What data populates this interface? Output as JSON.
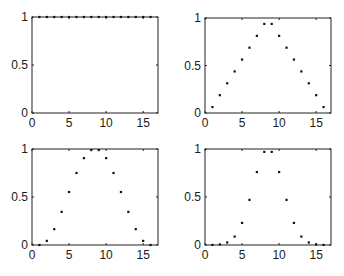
{
  "figure": {
    "background": "#ffffff",
    "axis_color": "#222222",
    "marker_color": "#111111"
  },
  "chart_data": [
    {
      "type": "scatter",
      "panel": "top-left",
      "title": "",
      "xlabel": "",
      "ylabel": "",
      "xlim": [
        0,
        17
      ],
      "ylim": [
        0,
        1
      ],
      "xticks": [
        0,
        5,
        10,
        15
      ],
      "xtick_labels": [
        "0",
        "5",
        "10",
        "15"
      ],
      "yticks": [
        0,
        0.5,
        1
      ],
      "ytick_labels": [
        "0",
        "0.5",
        "1"
      ],
      "grid": false,
      "legend": null,
      "x": [
        1,
        2,
        3,
        4,
        5,
        6,
        7,
        8,
        9,
        10,
        11,
        12,
        13,
        14,
        15,
        16
      ],
      "y": [
        1,
        1,
        1,
        1,
        1,
        1,
        1,
        1,
        1,
        1,
        1,
        1,
        1,
        1,
        1,
        1
      ]
    },
    {
      "type": "scatter",
      "panel": "top-right",
      "title": "",
      "xlabel": "",
      "ylabel": "",
      "xlim": [
        0,
        17
      ],
      "ylim": [
        0,
        1
      ],
      "xticks": [
        0,
        5,
        10,
        15
      ],
      "xtick_labels": [
        "0",
        "5",
        "10",
        "15"
      ],
      "yticks": [
        0,
        0.5,
        1
      ],
      "ytick_labels": [
        "0",
        "0.5",
        "1"
      ],
      "grid": false,
      "legend": null,
      "x": [
        1,
        2,
        3,
        4,
        5,
        6,
        7,
        8,
        9,
        10,
        11,
        12,
        13,
        14,
        15,
        16
      ],
      "y": [
        0.0625,
        0.1875,
        0.3125,
        0.4375,
        0.5625,
        0.6875,
        0.8125,
        0.9375,
        0.9375,
        0.8125,
        0.6875,
        0.5625,
        0.4375,
        0.3125,
        0.1875,
        0.0625
      ]
    },
    {
      "type": "scatter",
      "panel": "bottom-left",
      "title": "",
      "xlabel": "",
      "ylabel": "",
      "xlim": [
        0,
        17
      ],
      "ylim": [
        0,
        1
      ],
      "xticks": [
        0,
        5,
        10,
        15
      ],
      "xtick_labels": [
        "0",
        "5",
        "10",
        "15"
      ],
      "yticks": [
        0,
        0.5,
        1
      ],
      "ytick_labels": [
        "0",
        "0.5",
        "1"
      ],
      "grid": false,
      "legend": null,
      "x": [
        1,
        2,
        3,
        4,
        5,
        6,
        7,
        8,
        9,
        10,
        11,
        12,
        13,
        14,
        15,
        16
      ],
      "y": [
        0,
        0.043,
        0.165,
        0.345,
        0.552,
        0.75,
        0.905,
        0.989,
        0.989,
        0.905,
        0.75,
        0.552,
        0.345,
        0.165,
        0.043,
        0
      ]
    },
    {
      "type": "scatter",
      "panel": "bottom-right",
      "title": "",
      "xlabel": "",
      "ylabel": "",
      "xlim": [
        0,
        17
      ],
      "ylim": [
        0,
        1
      ],
      "xticks": [
        0,
        5,
        10,
        15
      ],
      "xtick_labels": [
        "0",
        "5",
        "10",
        "15"
      ],
      "yticks": [
        0,
        0.5,
        1
      ],
      "ytick_labels": [
        "0",
        "0.5",
        "1"
      ],
      "grid": false,
      "legend": null,
      "x": [
        1,
        2,
        3,
        4,
        5,
        6,
        7,
        8,
        9,
        10,
        11,
        12,
        13,
        14,
        15,
        16
      ],
      "y": [
        0.001,
        0.006,
        0.026,
        0.088,
        0.23,
        0.47,
        0.76,
        0.97,
        0.97,
        0.76,
        0.47,
        0.23,
        0.088,
        0.026,
        0.006,
        0.001
      ]
    }
  ]
}
